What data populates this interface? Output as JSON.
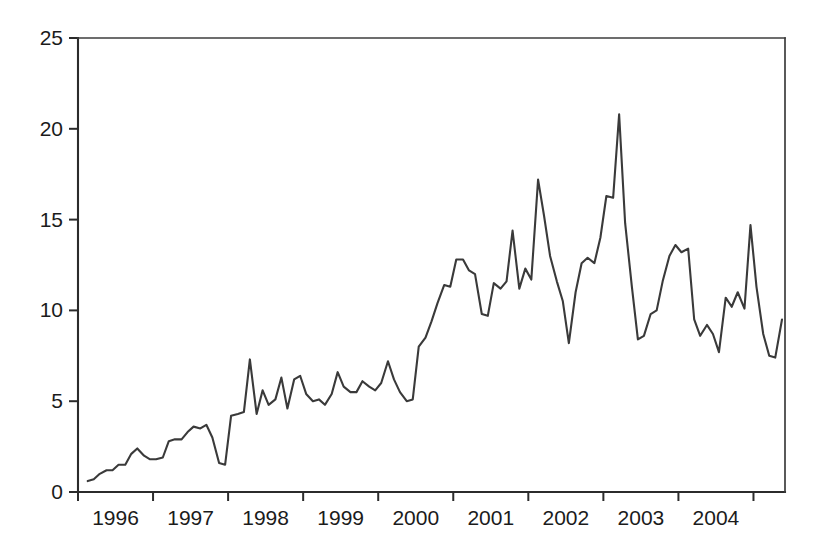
{
  "chart_data": {
    "type": "line",
    "title": "",
    "subtitle": "",
    "xlabel": "",
    "ylabel": "",
    "xlim": [
      1995.5,
      2004.92
    ],
    "ylim": [
      0,
      25
    ],
    "grid": false,
    "legend": null,
    "legend_position": "none",
    "annotations": [],
    "x_tick_labels": [
      "1996",
      "1997",
      "1998",
      "1999",
      "2000",
      "2001",
      "2002",
      "2003",
      "2004"
    ],
    "x_tick_values": [
      1996,
      1997,
      1998,
      1999,
      2000,
      2001,
      2002,
      2003,
      2004
    ],
    "y_tick_labels": [
      "0",
      "5",
      "10",
      "15",
      "20",
      "25"
    ],
    "y_tick_values": [
      0,
      5,
      10,
      15,
      20,
      25
    ],
    "series": [
      {
        "name": "series-1",
        "color": "#3a3a3a",
        "x": [
          1995.63,
          1995.71,
          1995.79,
          1995.88,
          1995.96,
          1996.04,
          1996.13,
          1996.21,
          1996.29,
          1996.38,
          1996.46,
          1996.54,
          1996.63,
          1996.71,
          1996.79,
          1996.88,
          1996.96,
          1997.04,
          1997.13,
          1997.21,
          1997.29,
          1997.38,
          1997.46,
          1997.54,
          1997.63,
          1997.71,
          1997.79,
          1997.88,
          1997.96,
          1998.04,
          1998.13,
          1998.21,
          1998.29,
          1998.38,
          1998.46,
          1998.54,
          1998.63,
          1998.71,
          1998.79,
          1998.88,
          1998.96,
          1999.04,
          1999.13,
          1999.21,
          1999.29,
          1999.38,
          1999.46,
          1999.54,
          1999.63,
          1999.71,
          1999.79,
          1999.88,
          1999.96,
          2000.04,
          2000.13,
          2000.21,
          2000.29,
          2000.38,
          2000.46,
          2000.54,
          2000.63,
          2000.71,
          2000.79,
          2000.88,
          2000.96,
          2001.04,
          2001.13,
          2001.21,
          2001.29,
          2001.38,
          2001.46,
          2001.54,
          2001.63,
          2001.71,
          2001.79,
          2001.88,
          2001.96,
          2002.04,
          2002.13,
          2002.21,
          2002.29,
          2002.38,
          2002.46,
          2002.54,
          2002.63,
          2002.71,
          2002.79,
          2002.88,
          2002.96,
          2003.04,
          2003.13,
          2003.21,
          2003.29,
          2003.38,
          2003.46,
          2003.54,
          2003.63,
          2003.71,
          2003.79,
          2003.88,
          2003.96,
          2004.04,
          2004.13,
          2004.21,
          2004.29,
          2004.38,
          2004.46,
          2004.54,
          2004.63,
          2004.71,
          2004.79,
          2004.88
        ],
        "y": [
          0.6,
          0.7,
          1.0,
          1.2,
          1.2,
          1.5,
          1.5,
          2.1,
          2.4,
          2.0,
          1.8,
          1.8,
          1.9,
          2.8,
          2.9,
          2.9,
          3.3,
          3.6,
          3.5,
          3.7,
          3.0,
          1.6,
          1.5,
          4.2,
          4.3,
          4.4,
          7.3,
          4.3,
          5.6,
          4.8,
          5.1,
          6.3,
          4.6,
          6.2,
          6.4,
          5.4,
          5.0,
          5.1,
          4.8,
          5.4,
          6.6,
          5.8,
          5.5,
          5.5,
          6.1,
          5.8,
          5.6,
          6.0,
          7.2,
          6.2,
          5.5,
          5.0,
          5.1,
          8.0,
          8.5,
          9.4,
          10.4,
          11.4,
          11.3,
          12.8,
          12.8,
          12.2,
          12.0,
          9.8,
          9.7,
          11.5,
          11.2,
          11.6,
          14.4,
          11.2,
          12.3,
          11.7,
          17.2,
          15.2,
          13.0,
          11.6,
          10.5,
          8.2,
          11.0,
          12.6,
          12.9,
          12.6,
          14.0,
          16.3,
          16.2,
          20.8,
          14.8,
          11.3,
          8.4,
          8.6,
          9.8,
          10.0,
          11.6,
          13.0,
          13.6,
          13.2,
          13.4,
          9.5,
          8.6,
          9.2,
          8.7,
          7.7,
          10.7,
          10.2,
          11.0,
          10.1,
          14.7,
          11.3,
          8.7,
          7.5,
          7.4,
          9.5
        ]
      }
    ]
  }
}
